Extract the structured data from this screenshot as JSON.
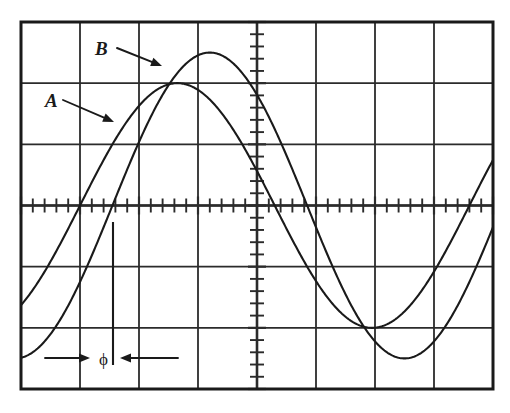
{
  "figure": {
    "kind": "oscilloscope-screen",
    "background_color": "#ffffff",
    "trace_color": "#1a1a1a",
    "graticule_color": "#2b2b2b",
    "border_color": "#1a1a1a"
  },
  "graticule": {
    "left": 21,
    "top": 22,
    "right": 493,
    "bottom": 389,
    "columns": 8,
    "rows": 6,
    "minor_ticks_per_division": 5,
    "center_x": 257,
    "center_y": 205.5,
    "grid_visible": true
  },
  "labels": {
    "trace_a": "A",
    "trace_b": "B",
    "phase": "ϕ"
  },
  "annotations": {
    "a_arrow": {
      "from_x": 63,
      "from_y": 100,
      "to_x": 114,
      "to_y": 122
    },
    "b_arrow": {
      "from_x": 117,
      "from_y": 48,
      "to_x": 162,
      "to_y": 66
    },
    "phase_left_arrow": {
      "from_x": 45,
      "from_y": 358,
      "to_x": 90,
      "to_y": 358
    },
    "phase_right_arrow": {
      "from_x": 178,
      "from_y": 358,
      "to_x": 120,
      "to_y": 358
    },
    "phase_marker_line": {
      "x": 113,
      "y_top": 222,
      "y_bottom": 365
    }
  },
  "chart_data": {
    "type": "line",
    "title": "",
    "subtitle": "",
    "xlabel": "",
    "ylabel": "",
    "xlim": [
      0,
      8
    ],
    "ylim": [
      -3,
      3
    ],
    "grid": true,
    "legend_position": "inline-annotated",
    "x_unit": "division",
    "y_unit": "division",
    "divisions": {
      "horizontal": 8,
      "vertical": 6
    },
    "annotations": [
      {
        "text": "A",
        "refers_to": "Trace A",
        "type": "arrow-label"
      },
      {
        "text": "B",
        "refers_to": "Trace B",
        "type": "arrow-label"
      },
      {
        "text": "ϕ",
        "refers_to": "phase difference between A and B",
        "type": "span-measure"
      }
    ],
    "series": [
      {
        "name": "A",
        "waveform": "sine",
        "amplitude_div": 2.0,
        "period_div": 6.6,
        "zero_crossing_rising_div": 1.0,
        "peak_div": [
          2.65,
          2.0
        ],
        "trough_div": [
          5.95,
          -2.0
        ],
        "phase_deg": 0
      },
      {
        "name": "B",
        "waveform": "sine",
        "amplitude_div": 2.5,
        "period_div": 6.6,
        "zero_crossing_rising_div": 1.55,
        "peak_div": [
          3.2,
          2.5
        ],
        "trough_div": [
          6.5,
          -2.5
        ],
        "phase_deg": -30
      }
    ],
    "measurement": {
      "label": "ϕ",
      "description": "horizontal separation between rising zero crossings of A and B",
      "span_div": 0.55
    }
  }
}
